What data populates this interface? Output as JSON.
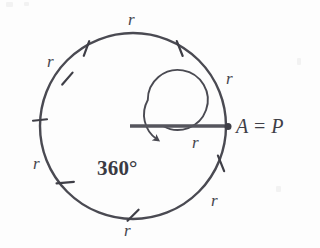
{
  "figure": {
    "caption_point_label": "A = P",
    "angle_label": "360°",
    "radius_label": "r",
    "colors": {
      "stroke": "#4a4a52",
      "text": "#47474f",
      "background": "#fdfdfd",
      "radius_line": "#55555d"
    },
    "circle": {
      "center_x": 133,
      "center_y": 126,
      "radius": 93,
      "stroke_width": 2.4
    },
    "inner_arc": {
      "center_x": 133,
      "center_y": 126,
      "radius": 30,
      "stroke_width": 1.8,
      "sweep_label": "360°"
    },
    "radius_line": {
      "from_x": 133,
      "from_y": 126,
      "to_x": 228,
      "to_y": 126,
      "stroke_width": 3.2
    },
    "point_a": {
      "x": 228,
      "y": 126,
      "dot_radius": 3.4
    },
    "tick_marks_deg": [
      150,
      120,
      60,
      30,
      332,
      250,
      205
    ],
    "arc_labels": [
      {
        "text": "r",
        "x": 128,
        "y": 11
      },
      {
        "text": "r",
        "x": 47,
        "y": 53
      },
      {
        "text": "r",
        "x": 226,
        "y": 70
      },
      {
        "text": "r",
        "x": 33,
        "y": 155
      },
      {
        "text": "r",
        "x": 192,
        "y": 134
      },
      {
        "text": "r",
        "x": 211,
        "y": 192
      },
      {
        "text": "r",
        "x": 124,
        "y": 222
      }
    ],
    "angle_label_pos": {
      "x": 97,
      "y": 158
    },
    "point_label_pos": {
      "x": 236,
      "y": 116
    }
  }
}
